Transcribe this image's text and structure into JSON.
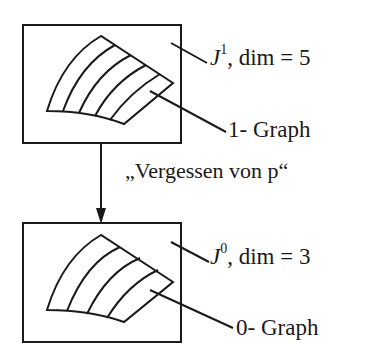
{
  "diagram": {
    "top_box": {
      "space_symbol": "J",
      "space_superscript": "1",
      "dim_text": ", dim = 5",
      "graph_label": "1- Graph"
    },
    "arrow_label": "„Vergessen von p“",
    "bottom_box": {
      "space_symbol": "J",
      "space_superscript": "0",
      "dim_text": ", dim = 3",
      "graph_label": "0- Graph"
    },
    "colors": {
      "stroke": "#1a1a1a",
      "background": "#ffffff"
    }
  }
}
